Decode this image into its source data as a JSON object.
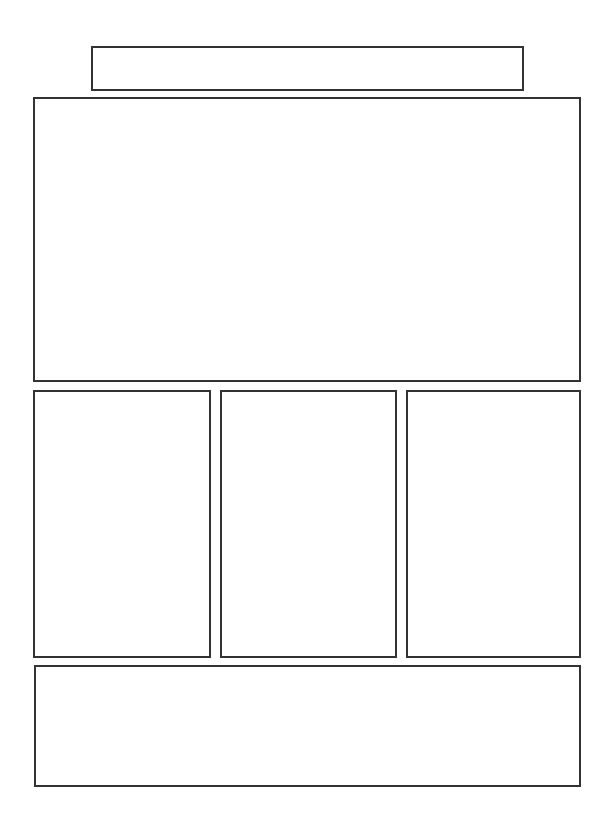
{
  "wireframe": {
    "border_color": "#333333",
    "background_color": "#ffffff",
    "regions": {
      "header": {
        "label": ""
      },
      "hero": {
        "label": ""
      },
      "columns": [
        {
          "label": ""
        },
        {
          "label": ""
        },
        {
          "label": ""
        }
      ],
      "footer": {
        "label": ""
      }
    }
  }
}
